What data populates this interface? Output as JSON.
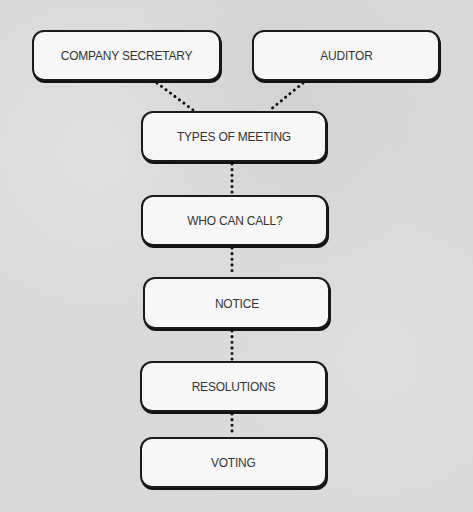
{
  "diagram": {
    "type": "flowchart",
    "background_color": "#d9d9d9",
    "box_fill": "#f7f7f7",
    "box_border": "#1a1a1a",
    "connector_style": "dotted",
    "nodes": [
      {
        "id": "company_secretary",
        "label": "COMPANY SECRETARY"
      },
      {
        "id": "auditor",
        "label": "AUDITOR"
      },
      {
        "id": "types_of_meeting",
        "label": "TYPES OF MEETING"
      },
      {
        "id": "who_can_call",
        "label": "WHO CAN CALL?"
      },
      {
        "id": "notice",
        "label": "NOTICE"
      },
      {
        "id": "resolutions",
        "label": "RESOLUTIONS"
      },
      {
        "id": "voting",
        "label": "VOTING"
      }
    ],
    "edges": [
      {
        "from": "company_secretary",
        "to": "types_of_meeting"
      },
      {
        "from": "auditor",
        "to": "types_of_meeting"
      },
      {
        "from": "types_of_meeting",
        "to": "who_can_call"
      },
      {
        "from": "who_can_call",
        "to": "notice"
      },
      {
        "from": "notice",
        "to": "resolutions"
      },
      {
        "from": "resolutions",
        "to": "voting"
      }
    ]
  }
}
